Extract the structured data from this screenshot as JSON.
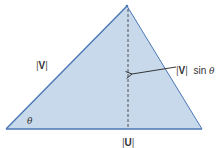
{
  "diagram": {
    "colors": {
      "fill": "#c9d9ec",
      "edge": "#4a77b4",
      "dashed": "#444444",
      "arrow": "#222222",
      "text": "#333333"
    },
    "labels": {
      "v_magnitude": {
        "bar_open": "|",
        "vector": "V",
        "bar_close": "|"
      },
      "height": {
        "bar_open": "|",
        "vector": "V",
        "bar_close": "|",
        "func": "sin",
        "angle": "θ"
      },
      "angle": "θ",
      "u_magnitude": {
        "bar_open": "|",
        "vector": "U",
        "bar_close": "|"
      }
    },
    "elements": [
      {
        "name": "triangle",
        "description": "shaded triangle spanned by U (base) and V (left side)"
      },
      {
        "name": "height-line",
        "description": "dashed perpendicular from apex to base"
      },
      {
        "name": "callout-arrow",
        "description": "arrow pointing to height line"
      }
    ]
  }
}
